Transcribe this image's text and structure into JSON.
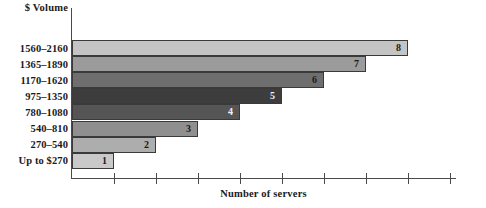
{
  "chart_data": {
    "type": "bar",
    "orientation": "horizontal",
    "title": "",
    "xlabel": "Number of servers",
    "ylabel": "$ Volume",
    "categories": [
      "Up to $270",
      "270–540",
      "540–810",
      "780–1080",
      "975–1350",
      "1170–1620",
      "1365–1890",
      "1560–2160"
    ],
    "values": [
      1,
      2,
      3,
      4,
      5,
      6,
      7,
      8
    ],
    "value_labels": [
      "1",
      "2",
      "3",
      "4",
      "5",
      "6",
      "7",
      "8"
    ],
    "xlim": [
      0,
      9
    ],
    "xticks": [
      1,
      2,
      3,
      4,
      5,
      6,
      7,
      8,
      9
    ],
    "xtick_labels": [
      "",
      "",
      "",
      "",
      "",
      "",
      "",
      "",
      ""
    ],
    "grid": false,
    "legend": false,
    "bar_colors": [
      "#c9c9c9",
      "#adadad",
      "#8f8f8f",
      "#555555",
      "#3d3d3d",
      "#6e6e6e",
      "#9b9b9b",
      "#c4c4c4"
    ],
    "label_colors": [
      "#1a1a1a",
      "#1a1a1a",
      "#1a1a1a",
      "#f2f2f2",
      "#f2f2f2",
      "#1a1a1a",
      "#1a1a1a",
      "#1a1a1a"
    ]
  },
  "axis": {
    "y_title": "$ Volume",
    "x_title": "Number of servers"
  }
}
